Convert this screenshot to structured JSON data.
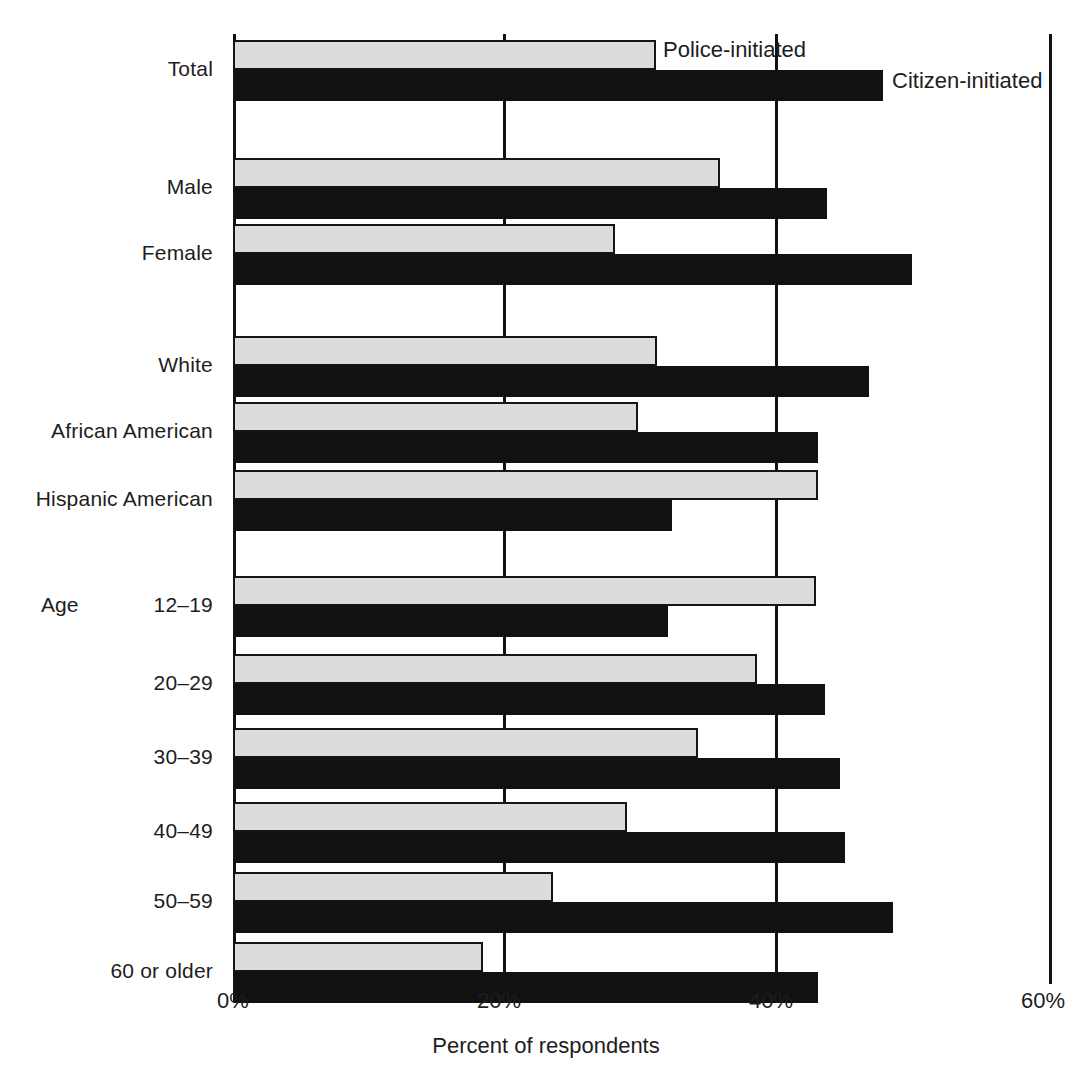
{
  "chart_data": {
    "type": "bar",
    "orientation": "horizontal",
    "title": "",
    "xlabel": "Percent of respondents",
    "ylabel": "",
    "xlim": [
      0,
      60
    ],
    "xticks": [
      "0%",
      "20%",
      "40%",
      "60%"
    ],
    "xtick_values": [
      0,
      20,
      40,
      60
    ],
    "grid": true,
    "legend_position": "inline-right",
    "series": [
      {
        "name": "Police-initiated",
        "color": "#dcdcdc",
        "values": [
          31.1,
          35.8,
          28.1,
          31.2,
          29.8,
          43.0,
          42.9,
          38.5,
          34.2,
          29.0,
          23.5,
          18.4
        ]
      },
      {
        "name": "Citizen-initiated",
        "color": "#111111",
        "values": [
          47.8,
          43.7,
          49.9,
          46.8,
          43.0,
          32.3,
          32.0,
          43.5,
          44.6,
          45.0,
          48.5,
          43.0
        ]
      }
    ],
    "categories": [
      "Total",
      "Male",
      "Female",
      "White",
      "African American",
      "Hispanic American",
      "12–19",
      "20–29",
      "30–39",
      "40–49",
      "50–59",
      "60 or older"
    ],
    "group_headings": [
      {
        "label": "Age",
        "applies_to_index": 6
      }
    ]
  },
  "axis": {
    "ticks": [
      {
        "label": "0%",
        "value": 0
      },
      {
        "label": "20%",
        "value": 20
      },
      {
        "label": "40%",
        "value": 40
      },
      {
        "label": "60%",
        "value": 60
      }
    ],
    "title": "Percent of respondents"
  },
  "legend": {
    "police_label": "Police-initiated",
    "citizen_label": "Citizen-initiated"
  },
  "colors": {
    "police": "#dcdcdc",
    "citizen": "#111111",
    "axis": "#111111",
    "text": "#1d1d1d",
    "background": "#ffffff"
  }
}
